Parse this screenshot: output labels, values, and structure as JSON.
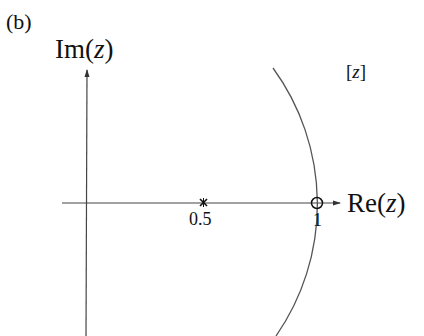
{
  "figure": {
    "panel_label": "(b)",
    "plane_label": "[z]",
    "axes": {
      "imag_label": "Im(z)",
      "real_label": "Re(z)"
    },
    "pole": {
      "marker": "x",
      "value": 0.5,
      "label": "0.5"
    },
    "zero": {
      "marker": "o",
      "value": 1,
      "label": "1"
    },
    "unit_circle": {
      "radius": 1,
      "description": "arc of unit circle"
    },
    "colors": {
      "ink": "#111111",
      "curve": "#555555",
      "axis": "#444444"
    }
  }
}
